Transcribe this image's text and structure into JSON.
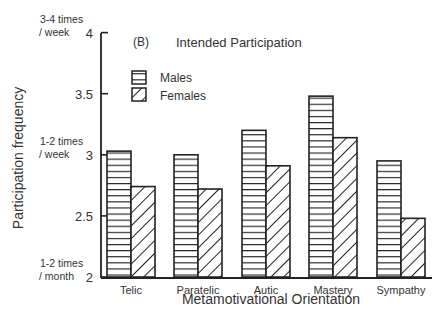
{
  "chart_data": {
    "type": "bar",
    "panel_label": "(B)",
    "title": "Intended Participation",
    "xlabel": "Metamotivational Orientation",
    "ylabel": "Participation frequency",
    "ylim": [
      2,
      4
    ],
    "yticks": [
      2,
      2.5,
      3,
      3.5,
      4
    ],
    "ytick_labels": [
      "2",
      "2.5",
      "3",
      "3.5",
      "4"
    ],
    "y_annotations": [
      {
        "value": 4,
        "line1": "3-4 times",
        "line2": "/ week"
      },
      {
        "value": 3,
        "line1": "1-2 times",
        "line2": "/ week"
      },
      {
        "value": 2,
        "line1": "1-2 times",
        "line2": "/ month"
      }
    ],
    "categories": [
      "Telic",
      "Paratelic",
      "Autic",
      "Mastery",
      "Sympathy"
    ],
    "series": [
      {
        "name": "Males",
        "pattern": "horizontal-lines",
        "values": [
          3.03,
          3.0,
          3.2,
          3.48,
          2.95
        ]
      },
      {
        "name": "Females",
        "pattern": "diagonal-hatch",
        "values": [
          2.74,
          2.72,
          2.91,
          3.14,
          2.48
        ]
      }
    ],
    "legend_position": "upper-left inside",
    "grid": false
  },
  "colors": {
    "ink": "#222222",
    "background": "#ffffff"
  }
}
